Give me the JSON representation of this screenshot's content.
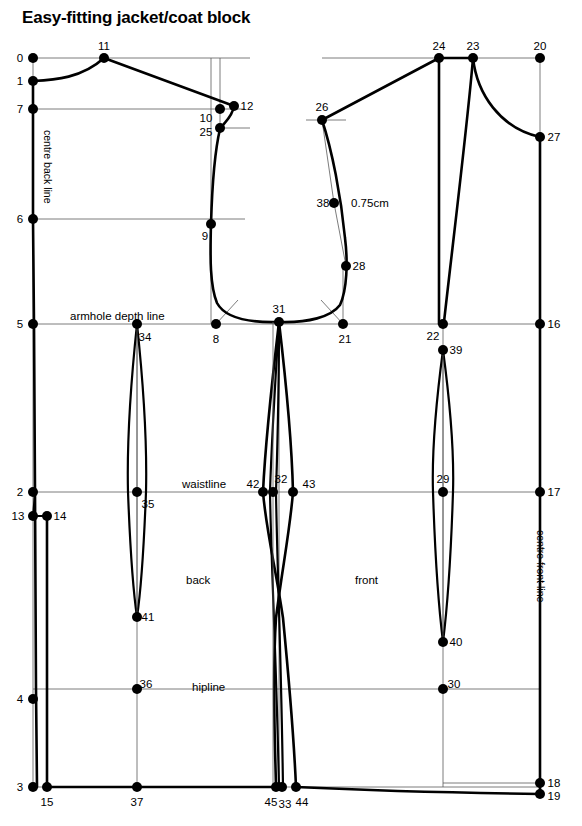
{
  "title": "Easy-fitting jacket/coat block",
  "labels": {
    "centre_back": "centre back line",
    "centre_front": "centre front line",
    "armhole_depth": "armhole depth line",
    "waistline": "waistline",
    "hipline": "hipline",
    "back": "back",
    "front": "front",
    "measure_075": "0.75cm"
  },
  "colors": {
    "ink": "#000000",
    "construction": "#5a5a5a",
    "paper": "#ffffff"
  },
  "chart_data": {
    "type": "diagram",
    "title": "Easy-fitting jacket/coat block",
    "points": [
      {
        "id": "0",
        "x": 33,
        "y": 58,
        "lx": 20,
        "ly": 62,
        "anchor": "middle"
      },
      {
        "id": "1",
        "x": 33,
        "y": 81,
        "lx": 20,
        "ly": 85,
        "anchor": "middle"
      },
      {
        "id": "7",
        "x": 33,
        "y": 109,
        "lx": 20,
        "ly": 113,
        "anchor": "middle"
      },
      {
        "id": "6",
        "x": 33,
        "y": 219,
        "lx": 20,
        "ly": 223,
        "anchor": "middle"
      },
      {
        "id": "5",
        "x": 33,
        "y": 324,
        "lx": 20,
        "ly": 328,
        "anchor": "middle"
      },
      {
        "id": "2",
        "x": 33,
        "y": 492,
        "lx": 20,
        "ly": 496,
        "anchor": "middle"
      },
      {
        "id": "13",
        "x": 33,
        "y": 516,
        "lx": 18,
        "ly": 520,
        "anchor": "middle"
      },
      {
        "id": "14",
        "x": 47,
        "y": 516,
        "lx": 60,
        "ly": 520,
        "anchor": "middle"
      },
      {
        "id": "4",
        "x": 33,
        "y": 699,
        "lx": 20,
        "ly": 703,
        "anchor": "middle"
      },
      {
        "id": "3",
        "x": 33,
        "y": 787,
        "lx": 20,
        "ly": 791,
        "anchor": "middle"
      },
      {
        "id": "15",
        "x": 47,
        "y": 787,
        "lx": 47,
        "ly": 806,
        "anchor": "middle"
      },
      {
        "id": "11",
        "x": 104,
        "y": 58,
        "lx": 104,
        "ly": 50,
        "anchor": "middle"
      },
      {
        "id": "10",
        "x": 220,
        "y": 109,
        "lx": 206,
        "ly": 122,
        "anchor": "middle"
      },
      {
        "id": "12",
        "x": 234,
        "y": 106,
        "lx": 247,
        "ly": 110,
        "anchor": "middle"
      },
      {
        "id": "25",
        "x": 220,
        "y": 128,
        "lx": 206,
        "ly": 136,
        "anchor": "middle"
      },
      {
        "id": "9",
        "x": 211,
        "y": 224,
        "lx": 205,
        "ly": 240,
        "anchor": "middle"
      },
      {
        "id": "8",
        "x": 216,
        "y": 324,
        "lx": 216,
        "ly": 343,
        "anchor": "middle"
      },
      {
        "id": "31",
        "x": 279,
        "y": 322,
        "lx": 279,
        "ly": 313,
        "anchor": "middle"
      },
      {
        "id": "21",
        "x": 343,
        "y": 324,
        "lx": 345,
        "ly": 343,
        "anchor": "middle"
      },
      {
        "id": "34",
        "x": 137,
        "y": 324,
        "lx": 145,
        "ly": 341,
        "anchor": "middle"
      },
      {
        "id": "35",
        "x": 137,
        "y": 492,
        "lx": 148,
        "ly": 508,
        "anchor": "middle"
      },
      {
        "id": "41",
        "x": 137,
        "y": 617,
        "lx": 148,
        "ly": 621,
        "anchor": "middle"
      },
      {
        "id": "36",
        "x": 137,
        "y": 689,
        "lx": 146,
        "ly": 688,
        "anchor": "middle"
      },
      {
        "id": "37",
        "x": 137,
        "y": 787,
        "lx": 137,
        "ly": 806,
        "anchor": "middle"
      },
      {
        "id": "42",
        "x": 263,
        "y": 492,
        "lx": 253,
        "ly": 488,
        "anchor": "middle"
      },
      {
        "id": "32",
        "x": 273,
        "y": 492,
        "lx": 281,
        "ly": 483,
        "anchor": "middle"
      },
      {
        "id": "43",
        "x": 293,
        "y": 492,
        "lx": 309,
        "ly": 488,
        "anchor": "middle"
      },
      {
        "id": "45",
        "x": 276,
        "y": 787,
        "lx": 271,
        "ly": 806,
        "anchor": "middle"
      },
      {
        "id": "33",
        "x": 282,
        "y": 787,
        "lx": 285,
        "ly": 808,
        "anchor": "middle"
      },
      {
        "id": "44",
        "x": 296,
        "y": 787,
        "lx": 302,
        "ly": 806,
        "anchor": "middle"
      },
      {
        "id": "26",
        "x": 322,
        "y": 120,
        "lx": 322,
        "ly": 111,
        "anchor": "middle"
      },
      {
        "id": "38",
        "x": 334,
        "y": 203,
        "lx": 323,
        "ly": 207,
        "anchor": "middle"
      },
      {
        "id": "28",
        "x": 346,
        "y": 266,
        "lx": 359,
        "ly": 270,
        "anchor": "middle"
      },
      {
        "id": "24",
        "x": 439,
        "y": 58,
        "lx": 439,
        "ly": 50,
        "anchor": "middle"
      },
      {
        "id": "23",
        "x": 473,
        "y": 58,
        "lx": 473,
        "ly": 50,
        "anchor": "middle"
      },
      {
        "id": "20",
        "x": 540,
        "y": 58,
        "lx": 540,
        "ly": 50,
        "anchor": "middle"
      },
      {
        "id": "27",
        "x": 540,
        "y": 137,
        "lx": 554,
        "ly": 141,
        "anchor": "middle"
      },
      {
        "id": "22",
        "x": 443,
        "y": 324,
        "lx": 433,
        "ly": 340,
        "anchor": "middle"
      },
      {
        "id": "39",
        "x": 443,
        "y": 350,
        "lx": 456,
        "ly": 354,
        "anchor": "middle"
      },
      {
        "id": "16",
        "x": 540,
        "y": 324,
        "lx": 554,
        "ly": 328,
        "anchor": "middle"
      },
      {
        "id": "29",
        "x": 443,
        "y": 492,
        "lx": 443,
        "ly": 483,
        "anchor": "middle"
      },
      {
        "id": "40",
        "x": 443,
        "y": 642,
        "lx": 456,
        "ly": 646,
        "anchor": "middle"
      },
      {
        "id": "17",
        "x": 540,
        "y": 492,
        "lx": 554,
        "ly": 496,
        "anchor": "middle"
      },
      {
        "id": "30",
        "x": 443,
        "y": 689,
        "lx": 454,
        "ly": 688,
        "anchor": "middle"
      },
      {
        "id": "18",
        "x": 540,
        "y": 783,
        "lx": 554,
        "ly": 787,
        "anchor": "middle"
      },
      {
        "id": "19",
        "x": 540,
        "y": 794,
        "lx": 554,
        "ly": 800,
        "anchor": "middle"
      }
    ],
    "horizontal_lines": [
      {
        "name": "line-0",
        "y": 58,
        "x1": 33,
        "x2": 250
      },
      {
        "name": "line-0-right",
        "y": 58,
        "x1": 322,
        "x2": 541
      },
      {
        "name": "line-7",
        "y": 109,
        "x1": 33,
        "x2": 245
      },
      {
        "name": "line-25",
        "y": 128,
        "x1": 220,
        "x2": 250
      },
      {
        "name": "line-26",
        "y": 120,
        "x1": 306,
        "x2": 345
      },
      {
        "name": "line-6",
        "y": 219,
        "x1": 33,
        "x2": 245
      },
      {
        "name": "armhole-depth-line",
        "y": 324,
        "x1": 33,
        "x2": 541
      },
      {
        "name": "waistline",
        "y": 492,
        "x1": 33,
        "x2": 541
      },
      {
        "name": "hipline",
        "y": 689,
        "x1": 33,
        "x2": 541
      },
      {
        "name": "hem-line",
        "y": 787,
        "x1": 33,
        "x2": 541
      }
    ],
    "vertical_lines": [
      {
        "name": "centre-back-line",
        "x": 33,
        "y1": 58,
        "y2": 787
      },
      {
        "name": "back-dart-axis",
        "x": 137,
        "y1": 324,
        "y2": 787
      },
      {
        "name": "line-9",
        "x": 211,
        "y1": 58,
        "y2": 324
      },
      {
        "name": "line-21",
        "x": 343,
        "y1": 266,
        "y2": 324
      },
      {
        "name": "side-seam-axis",
        "x": 279,
        "y1": 322,
        "y2": 787
      },
      {
        "name": "line-24",
        "x": 439,
        "y1": 58,
        "y2": 324
      },
      {
        "name": "front-dart-axis",
        "x": 443,
        "y1": 324,
        "y2": 787
      },
      {
        "name": "centre-front-line",
        "x": 540,
        "y1": 58,
        "y2": 794
      }
    ]
  }
}
